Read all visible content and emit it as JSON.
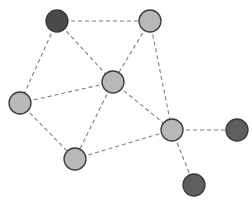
{
  "diagram": {
    "type": "network-graph",
    "width": 252,
    "height": 205,
    "colors": {
      "light_node": "#b8b8b8",
      "dark_node": "#5e5e5e",
      "darkest_node": "#4a4a4a",
      "edge": "#7d7d7d",
      "node_stroke": "#3a3a3a"
    },
    "nodes": [
      {
        "id": "n1",
        "x": 57,
        "y": 21,
        "r": 11,
        "fill": "#4a4a4a"
      },
      {
        "id": "n2",
        "x": 150,
        "y": 21,
        "r": 11,
        "fill": "#b8b8b8"
      },
      {
        "id": "n3",
        "x": 113,
        "y": 82,
        "r": 11,
        "fill": "#b8b8b8"
      },
      {
        "id": "n4",
        "x": 20,
        "y": 103,
        "r": 11,
        "fill": "#b8b8b8"
      },
      {
        "id": "n5",
        "x": 75,
        "y": 159,
        "r": 11,
        "fill": "#b8b8b8"
      },
      {
        "id": "n6",
        "x": 172,
        "y": 130,
        "r": 11,
        "fill": "#b8b8b8"
      },
      {
        "id": "n7",
        "x": 237,
        "y": 130,
        "r": 11,
        "fill": "#5e5e5e"
      },
      {
        "id": "n8",
        "x": 194,
        "y": 185,
        "r": 11,
        "fill": "#5e5e5e"
      }
    ],
    "edges": [
      [
        "n1",
        "n2"
      ],
      [
        "n1",
        "n3"
      ],
      [
        "n1",
        "n4"
      ],
      [
        "n2",
        "n3"
      ],
      [
        "n2",
        "n6"
      ],
      [
        "n3",
        "n4"
      ],
      [
        "n3",
        "n5"
      ],
      [
        "n3",
        "n6"
      ],
      [
        "n4",
        "n5"
      ],
      [
        "n5",
        "n6"
      ],
      [
        "n6",
        "n7"
      ],
      [
        "n6",
        "n8"
      ]
    ]
  }
}
